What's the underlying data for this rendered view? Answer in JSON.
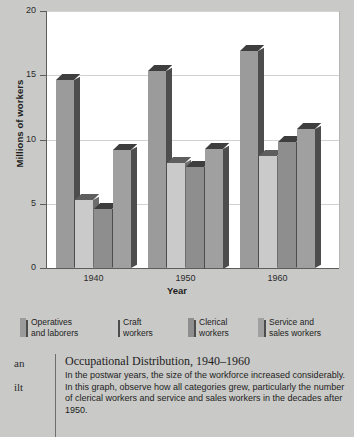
{
  "chart_data": {
    "type": "bar",
    "title": "",
    "xlabel": "Year",
    "ylabel": "Millions of workers",
    "categories": [
      "1940",
      "1950",
      "1960"
    ],
    "ylim": [
      0,
      20
    ],
    "yticks": [
      0,
      5,
      10,
      15,
      20
    ],
    "grid": true,
    "legend_position": "bottom",
    "series": [
      {
        "name": "Operatives and laborers",
        "values": [
          14.6,
          15.3,
          16.9
        ],
        "color": "#9b9b9b"
      },
      {
        "name": "Craft workers",
        "values": [
          5.3,
          8.2,
          8.7
        ],
        "color": "#cacaca"
      },
      {
        "name": "Clerical workers",
        "values": [
          4.6,
          7.9,
          9.8
        ],
        "color": "#8e8e8e"
      },
      {
        "name": "Service and sales workers",
        "values": [
          9.2,
          9.3,
          10.8
        ],
        "color": "#a0a0a0"
      }
    ]
  },
  "axis": {
    "y_title": "Millions of workers",
    "x_title": "Year",
    "y_tick_labels": [
      "20",
      "15",
      "10",
      "5",
      "0"
    ],
    "x_tick_labels": [
      "1940",
      "1950",
      "1960"
    ]
  },
  "legend": {
    "items": [
      {
        "label": "Operatives\nand laborers",
        "swatch_color": "#9b9b9b",
        "icon": "legend-swatch-icon"
      },
      {
        "label": "Craft\nworkers",
        "swatch_color": "#cacaca",
        "icon": "legend-swatch-icon"
      },
      {
        "label": "Clerical\nworkers",
        "swatch_color": "#8e8e8e",
        "icon": "legend-swatch-icon"
      },
      {
        "label": "Service and\nsales workers",
        "swatch_color": "#a0a0a0",
        "icon": "legend-swatch-icon"
      }
    ]
  },
  "caption": {
    "title": "Occupational Distribution, 1940–1960",
    "body": "In the postwar years, the size of the workforce increased considerably. In this graph, observe how all categories grew, particularly the number of clerical workers and service and sales workers in the decades after 1950."
  },
  "margin_text": {
    "fragment_1": "an",
    "fragment_2": "ilt"
  },
  "colors": {
    "page_background": "#c9c9c7",
    "plot_background": "#ffffff",
    "gridline": "#d2d2d2",
    "axis": "#5d5d5d",
    "bar_side": "#4d4d4d",
    "bar_top": "#3e3e3e"
  }
}
